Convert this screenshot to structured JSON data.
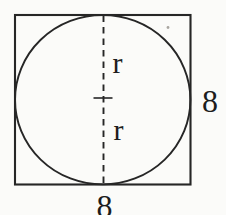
{
  "figure": {
    "labels": {
      "radius_upper": "r",
      "radius_lower": "r",
      "side_right": "8",
      "side_bottom": "8"
    },
    "colors": {
      "line": "#262626",
      "background": "#fbfbf9"
    }
  }
}
